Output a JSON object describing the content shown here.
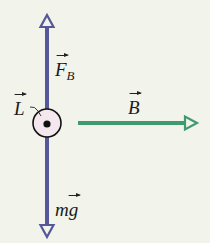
{
  "diagram": {
    "background": "#F2F3EA",
    "colors": {
      "vertical_force_arrows": "#56569A",
      "magnetic_field_arrow": "#3F9B6F",
      "wire_cross_section_fill": "#F4E7EE",
      "wire_outline": "#111111"
    },
    "labels": {
      "magnetic_force": {
        "symbol": "F",
        "subscript": "B",
        "vector": true
      },
      "length_vector": {
        "symbol": "L",
        "vector": true
      },
      "magnetic_field": {
        "symbol": "B",
        "vector": true
      },
      "gravity": {
        "symbol": "mg",
        "vector_on": "g"
      }
    },
    "elements": {
      "wire": "current out of page (dot in circle)",
      "force_up": "magnetic force arrow pointing up",
      "force_down": "weight arrow pointing down",
      "field": "magnetic field arrow pointing right"
    }
  }
}
